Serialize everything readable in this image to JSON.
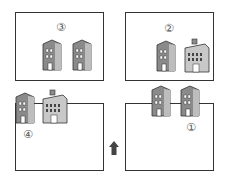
{
  "panels": [
    {
      "id": "panel-3",
      "label": "③",
      "buildings": [
        "tall-office",
        "tall-office"
      ]
    },
    {
      "id": "panel-2",
      "label": "②",
      "buildings": [
        "tall-office",
        "wide-office-with-rooftop"
      ]
    },
    {
      "id": "panel-4",
      "label": "④",
      "buildings": [
        "tall-office",
        "wide-office-with-rooftop"
      ]
    },
    {
      "id": "panel-1",
      "label": "①",
      "buildings": [
        "tall-office",
        "tall-office"
      ]
    }
  ],
  "arrow": {
    "direction": "up",
    "color": "#444444"
  },
  "colors": {
    "building": "#8a8a8a",
    "building_light": "#d0d0d0",
    "outline": "#333333"
  }
}
